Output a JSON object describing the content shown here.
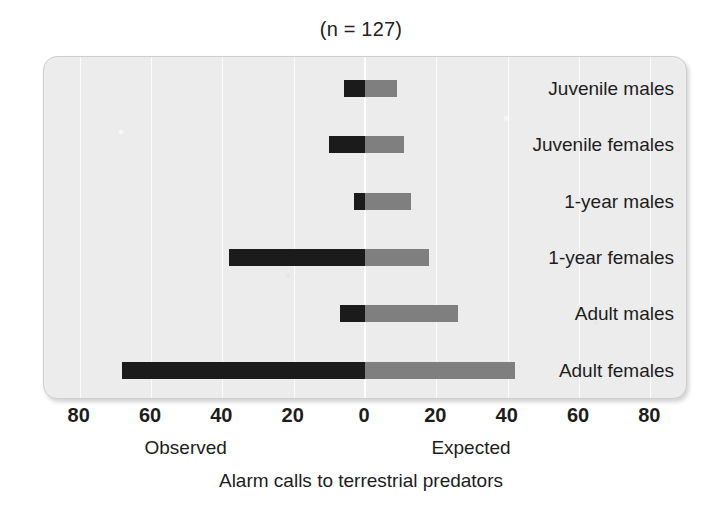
{
  "chart_data": {
    "type": "bar",
    "orientation": "horizontal",
    "title": "(n = 127)",
    "xlabel": "Alarm calls to terrestrial predators",
    "ylabel": "",
    "xlim": [
      -90,
      90
    ],
    "grid": true,
    "legend_position": "none",
    "categories": [
      "Juvenile males",
      "Juvenile females",
      "1-year males",
      "1-year females",
      "Adult males",
      "Adult females"
    ],
    "series": [
      {
        "name": "Observed",
        "direction": "left",
        "color": "#1b1b1b",
        "values": [
          6,
          10,
          3,
          38,
          7,
          68
        ]
      },
      {
        "name": "Expected",
        "direction": "right",
        "color": "#7f7f7f",
        "values": [
          9,
          11,
          13,
          18,
          26,
          42
        ]
      }
    ],
    "x_ticks": [
      {
        "value": -80,
        "label": "80"
      },
      {
        "value": -60,
        "label": "60"
      },
      {
        "value": -40,
        "label": "40"
      },
      {
        "value": -20,
        "label": "20"
      },
      {
        "value": 0,
        "label": "0"
      },
      {
        "value": 20,
        "label": "20"
      },
      {
        "value": 40,
        "label": "40"
      },
      {
        "value": 60,
        "label": "60"
      },
      {
        "value": 80,
        "label": "80"
      }
    ],
    "axis_group_labels": [
      {
        "text": "Observed",
        "value": -50
      },
      {
        "text": "Expected",
        "value": 30
      }
    ],
    "colors": {
      "panel_background": "#ececec",
      "gridline": "#fbfbfb",
      "observed": "#1b1b1b",
      "expected": "#7f7f7f",
      "text": "#1d1d1d",
      "page_background": "#ffffff"
    }
  }
}
